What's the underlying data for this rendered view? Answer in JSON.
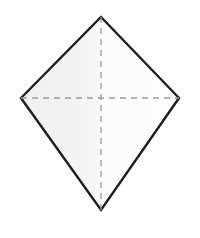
{
  "figure": {
    "name": "kite-quadrilateral",
    "canvas": {
      "width": 200,
      "height": 238,
      "background_color": "#FFFFFF"
    },
    "shape": {
      "type": "kite",
      "label": "kite-polygon",
      "fill_color": "#F2F3F2",
      "fill_color_right": "#FAFBFA",
      "stroke_color": "#1E1E1E",
      "stroke_width": 2.4,
      "vertices": [
        {
          "name": "top-vertex",
          "x": 101,
          "y": 17
        },
        {
          "name": "right-vertex",
          "x": 179,
          "y": 98
        },
        {
          "name": "bottom-vertex",
          "x": 101,
          "y": 210
        },
        {
          "name": "left-vertex",
          "x": 21,
          "y": 98
        }
      ],
      "points_path": "101,17 179,98 101,210 21,98"
    },
    "diagonals": {
      "stroke_color": "#9A9A9A",
      "stroke_width": 1.3,
      "dash_pattern": "6 5",
      "lines": [
        {
          "name": "vertical-diagonal",
          "orientation": "vertical",
          "x1": 101,
          "y1": 17,
          "x2": 101,
          "y2": 210
        },
        {
          "name": "horizontal-diagonal",
          "orientation": "horizontal",
          "x1": 21,
          "y1": 98,
          "x2": 179,
          "y2": 98
        }
      ],
      "intersection": {
        "name": "diagonal-intersection",
        "x": 101,
        "y": 98
      }
    }
  }
}
